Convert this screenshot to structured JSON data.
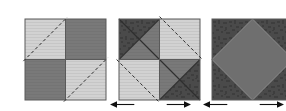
{
  "figure": {
    "type": "geometric-dissection-diagram",
    "caption": "",
    "background_color": "#ffffff",
    "panel_count": 3
  },
  "colors": {
    "light_gray": "#d2d2d2",
    "light_gray_stripe": "#c6c6c6",
    "mid_gray": "#797979",
    "diamond_gray": "#6f6f6f",
    "dark_texture": "#4a4a4a",
    "dark_texture_mottle": "#3e3e3e",
    "outline": "#5a5a5a",
    "dash_line": "#2b2b2b",
    "arrow": "#111111"
  },
  "panels": [
    {
      "id": "panel-1",
      "name": "checkerboard-square",
      "label": "",
      "x": 16,
      "y": 10,
      "size": 81,
      "description": "two-by-two checkerboard of light and dark quadrants with two parallel dashed diagonal cut lines",
      "quadrants": [
        {
          "position": "top-left",
          "fill": "light_gray"
        },
        {
          "position": "top-right",
          "fill": "mid_gray"
        },
        {
          "position": "bottom-left",
          "fill": "mid_gray"
        },
        {
          "position": "bottom-right",
          "fill": "light_gray"
        }
      ],
      "dashed_lines": [
        {
          "from": [
            -0.02,
            0.52
          ],
          "to": [
            0.52,
            -0.02
          ]
        },
        {
          "from": [
            0.48,
            1.02
          ],
          "to": [
            1.02,
            0.48
          ]
        }
      ]
    },
    {
      "id": "panel-2",
      "name": "pinwheel-square",
      "label": "",
      "x": 110,
      "y": 10,
      "size": 81,
      "description": "four quadrants split into triangles forming a pinwheel; dashed lines trace the inscribed rotated square",
      "quadrants": [
        {
          "position": "top-left",
          "upper_left_triangle": "dark_texture",
          "lower_right_triangle": "mid_gray"
        },
        {
          "position": "top-right",
          "fill": "light_gray"
        },
        {
          "position": "bottom-left",
          "fill": "light_gray"
        },
        {
          "position": "bottom-right",
          "upper_left_triangle": "mid_gray",
          "lower_right_triangle": "dark_texture"
        }
      ],
      "dashed_lines": [
        {
          "from": [
            0.5,
            -0.03
          ],
          "to": [
            1.03,
            0.5
          ]
        },
        {
          "from": [
            -0.03,
            0.5
          ],
          "to": [
            0.5,
            1.03
          ]
        }
      ],
      "solid_diagonals": [
        {
          "from": [
            0.0,
            0.0
          ],
          "to": [
            0.5,
            0.5
          ]
        },
        {
          "from": [
            0.5,
            0.5
          ],
          "to": [
            1.0,
            1.0
          ]
        },
        {
          "from": [
            0.5,
            0.0
          ],
          "to": [
            0.0,
            0.5
          ]
        },
        {
          "from": [
            1.0,
            0.5
          ],
          "to": [
            0.5,
            1.0
          ]
        }
      ]
    },
    {
      "id": "panel-3",
      "name": "inscribed-diamond-square",
      "label": "",
      "x": 203,
      "y": 10,
      "size": 81,
      "description": "dark textured square containing a mid gray inscribed rotated square (diamond) touching the midpoints of each side",
      "background_fill": "dark_texture",
      "diamond_fill": "diamond_gray",
      "diamond_vertices": [
        [
          0.5,
          0.0
        ],
        [
          1.0,
          0.5
        ],
        [
          0.5,
          1.0
        ],
        [
          0.0,
          0.5
        ]
      ]
    }
  ],
  "dimension_arrows": [
    {
      "id": "dim-1",
      "name": "width-dimension-panel-2",
      "label": "",
      "x": 110,
      "y": 99,
      "width": 81,
      "double_headed": true
    },
    {
      "id": "dim-2",
      "name": "width-dimension-panel-3",
      "label": "",
      "x": 203,
      "y": 99,
      "width": 81,
      "double_headed": true
    }
  ]
}
